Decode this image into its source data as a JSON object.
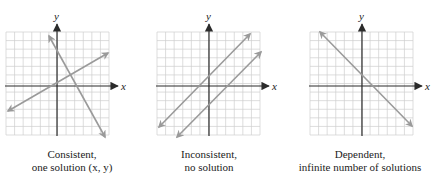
{
  "colors": {
    "grid": "#cfcfcf",
    "axis": "#2b2b2b",
    "line": "#9a9a9a",
    "text": "#222222"
  },
  "panels": [
    {
      "id": "consistent",
      "axis_x_label": "x",
      "axis_y_label": "y",
      "caption_line1": "Consistent,",
      "caption_line2": "one solution (x, y)",
      "origin": [
        57,
        86
      ],
      "grid": {
        "left": 6,
        "top": 32,
        "size": 103,
        "cells": 12
      },
      "lines": [
        {
          "x1": 8,
          "y1": 111,
          "x2": 108,
          "y2": 53
        },
        {
          "x1": 49,
          "y1": 36,
          "x2": 105,
          "y2": 137
        }
      ]
    },
    {
      "id": "inconsistent",
      "axis_x_label": "x",
      "axis_y_label": "y",
      "caption_line1": "Inconsistent,",
      "caption_line2": "no solution",
      "origin": [
        209,
        86
      ],
      "grid": {
        "left": 157,
        "top": 32,
        "size": 103,
        "cells": 12
      },
      "lines": [
        {
          "x1": 159,
          "y1": 127,
          "x2": 250,
          "y2": 34
        },
        {
          "x1": 177,
          "y1": 137,
          "x2": 261,
          "y2": 52
        }
      ]
    },
    {
      "id": "dependent",
      "axis_x_label": "x",
      "axis_y_label": "y",
      "caption_line1": "Dependent,",
      "caption_line2": "infinite number of solutions",
      "origin": [
        362,
        86
      ],
      "grid": {
        "left": 310,
        "top": 32,
        "size": 103,
        "cells": 12
      },
      "lines": [
        {
          "x1": 320,
          "y1": 32,
          "x2": 412,
          "y2": 126
        }
      ]
    }
  ]
}
